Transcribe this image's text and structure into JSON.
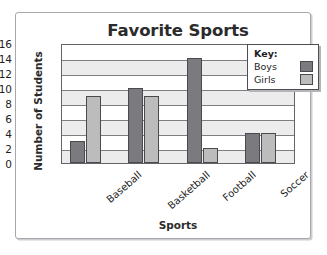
{
  "chart_data": {
    "type": "bar",
    "title": "Favorite Sports",
    "xlabel": "Sports",
    "ylabel": "Number of Students",
    "categories": [
      "Baseball",
      "Basketball",
      "Football",
      "Soccer"
    ],
    "series": [
      {
        "name": "Boys",
        "color": "#7b7b7f",
        "values": [
          3,
          10,
          14,
          4
        ]
      },
      {
        "name": "Girls",
        "color": "#bcbcbd",
        "values": [
          9,
          9,
          2,
          4
        ]
      }
    ],
    "ylim": [
      0,
      16
    ],
    "ytick_labels": [
      "0",
      "2",
      "4",
      "6",
      "8",
      "10",
      "12",
      "14",
      "16"
    ],
    "ytick_values": [
      0,
      2,
      4,
      6,
      8,
      10,
      12,
      14,
      16
    ],
    "grid": true,
    "legend_position": "top-right",
    "legend_title": "Key:"
  }
}
